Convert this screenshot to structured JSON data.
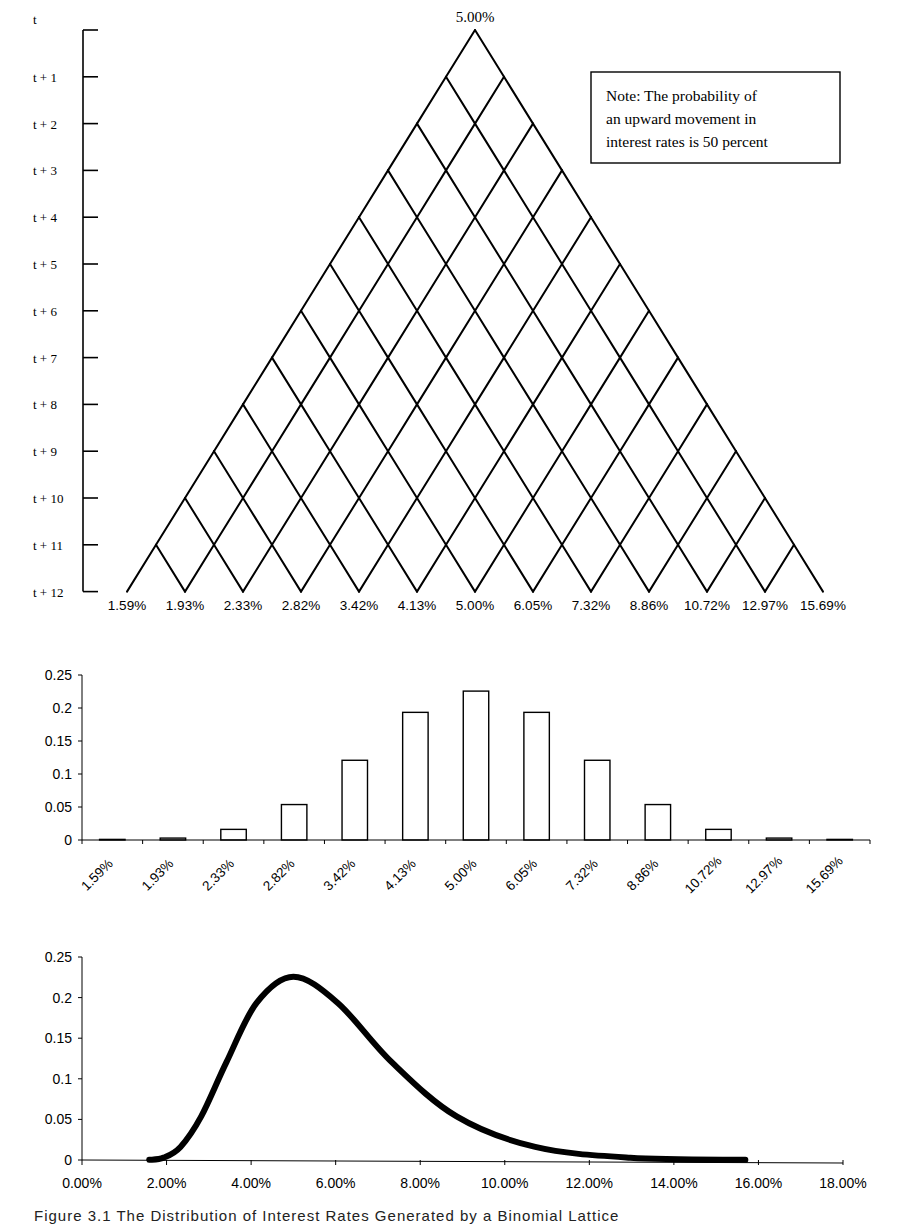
{
  "lattice": {
    "title_top": "5.00%",
    "time_labels": [
      "t",
      "t + 1",
      "t + 2",
      "t + 3",
      "t + 4",
      "t + 5",
      "t + 6",
      "t + 7",
      "t + 8",
      "t + 9",
      "t + 10",
      "t + 11",
      "t + 12"
    ],
    "terminal_rates": [
      "1.59%",
      "1.93%",
      "2.33%",
      "2.82%",
      "3.42%",
      "4.13%",
      "5.00%",
      "6.05%",
      "7.32%",
      "8.86%",
      "10.72%",
      "12.97%",
      "15.69%"
    ],
    "note_lines": [
      "Note: The probability of",
      "an upward movement in",
      "interest rates is 50 percent"
    ]
  },
  "caption": "Figure 3.1  The Distribution of Interest Rates Generated by a Binomial Lattice",
  "chart_data": [
    {
      "type": "diagram",
      "title": "Binomial interest rate lattice",
      "root_value": "5.00%",
      "steps": 12,
      "up_probability": 0.5,
      "y_labels": [
        "t",
        "t + 1",
        "t + 2",
        "t + 3",
        "t + 4",
        "t + 5",
        "t + 6",
        "t + 7",
        "t + 8",
        "t + 9",
        "t + 10",
        "t + 11",
        "t + 12"
      ],
      "terminal_values": [
        "1.59%",
        "1.93%",
        "2.33%",
        "2.82%",
        "3.42%",
        "4.13%",
        "5.00%",
        "6.05%",
        "7.32%",
        "8.86%",
        "10.72%",
        "12.97%",
        "15.69%"
      ],
      "annotation": "Note: The probability of an upward movement in interest rates is 50 percent"
    },
    {
      "type": "bar",
      "title": "",
      "xlabel": "",
      "ylabel": "",
      "categories": [
        "1.59%",
        "1.93%",
        "2.33%",
        "2.82%",
        "3.42%",
        "4.13%",
        "5.00%",
        "6.05%",
        "7.32%",
        "8.86%",
        "10.72%",
        "12.97%",
        "15.69%"
      ],
      "values": [
        0.0002,
        0.0029,
        0.0161,
        0.0537,
        0.1208,
        0.1934,
        0.2256,
        0.1934,
        0.1208,
        0.0537,
        0.0161,
        0.0029,
        0.0002
      ],
      "yticks": [
        "0",
        "0.05",
        "0.1",
        "0.15",
        "0.2",
        "0.25"
      ],
      "ylim": [
        0,
        0.25
      ],
      "grid": false,
      "legend": null,
      "x_tick_rotation": -45
    },
    {
      "type": "line",
      "title": "",
      "xlabel": "",
      "ylabel": "",
      "x": [
        1.59,
        1.93,
        2.33,
        2.82,
        3.42,
        4.13,
        5.0,
        6.05,
        7.32,
        8.86,
        10.72,
        12.97,
        15.69
      ],
      "values": [
        0.0002,
        0.0029,
        0.0161,
        0.0537,
        0.1208,
        0.1934,
        0.2256,
        0.1934,
        0.1208,
        0.0537,
        0.0161,
        0.0029,
        0.0002
      ],
      "xticks": [
        "0.00%",
        "2.00%",
        "4.00%",
        "6.00%",
        "8.00%",
        "10.00%",
        "12.00%",
        "14.00%",
        "16.00%",
        "18.00%"
      ],
      "yticks": [
        "0",
        "0.05",
        "0.1",
        "0.15",
        "0.2",
        "0.25"
      ],
      "xlim": [
        0,
        18
      ],
      "ylim": [
        0,
        0.25
      ],
      "grid": false,
      "legend": null
    }
  ],
  "bar_chart": {
    "yticks": [
      "0",
      "0.05",
      "0.1",
      "0.15",
      "0.2",
      "0.25"
    ],
    "categories": [
      "1.59%",
      "1.93%",
      "2.33%",
      "2.82%",
      "3.42%",
      "4.13%",
      "5.00%",
      "6.05%",
      "7.32%",
      "8.86%",
      "10.72%",
      "12.97%",
      "15.69%"
    ]
  },
  "line_chart": {
    "yticks": [
      "0",
      "0.05",
      "0.1",
      "0.15",
      "0.2",
      "0.25"
    ],
    "xticks": [
      "0.00%",
      "2.00%",
      "4.00%",
      "6.00%",
      "8.00%",
      "10.00%",
      "12.00%",
      "14.00%",
      "16.00%",
      "18.00%"
    ]
  }
}
